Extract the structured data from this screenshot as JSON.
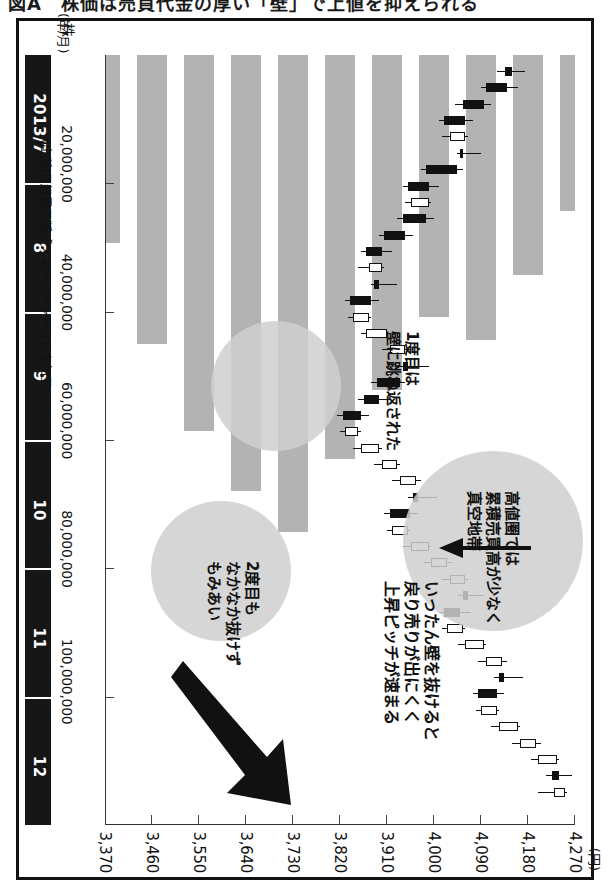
{
  "caption": {
    "text": "図A　株価は売買代金の厚い「壁」で上値を抑えられる"
  },
  "chart_data": {
    "type": "candlestick",
    "title": "",
    "xlabel": "(年/月)",
    "ylabel": "(円)",
    "price_axis": {
      "unit": "(円)",
      "ticks": [
        "3,370",
        "3,460",
        "3,550",
        "3,640",
        "3,730",
        "3,820",
        "3,910",
        "4,000",
        "4,090",
        "4,180",
        "4,270"
      ],
      "min": 3370,
      "max": 4270,
      "step": 90
    },
    "volume_axis": {
      "unit": "株",
      "ticks": [
        "20,000,000",
        "40,000,000",
        "60,000,000",
        "80,000,000",
        "100,000,000"
      ],
      "min": 0,
      "max": 110000000,
      "step": 20000000
    },
    "time_axis": {
      "unit": "(年/月)",
      "labels": [
        "2013/7",
        "8",
        "9",
        "10",
        "11",
        "12"
      ]
    },
    "series": [
      {
        "name": "株価（日足・ローソク足）",
        "type": "candlestick",
        "ohlc": [
          [
            4150,
            4175,
            4120,
            4135
          ],
          [
            4140,
            4160,
            4090,
            4100
          ],
          [
            4095,
            4110,
            4040,
            4055
          ],
          [
            4060,
            4075,
            4010,
            4020
          ],
          [
            4030,
            4065,
            4015,
            4060
          ],
          [
            4055,
            4090,
            4045,
            4050
          ],
          [
            4045,
            4055,
            3975,
            3985
          ],
          [
            3990,
            4010,
            3940,
            3950
          ],
          [
            3955,
            3995,
            3945,
            3990
          ],
          [
            3985,
            4000,
            3930,
            3940
          ],
          [
            3945,
            3960,
            3895,
            3905
          ],
          [
            3900,
            3920,
            3860,
            3870
          ],
          [
            3875,
            3905,
            3855,
            3900
          ],
          [
            3895,
            3930,
            3880,
            3885
          ],
          [
            3880,
            3895,
            3830,
            3840
          ],
          [
            3845,
            3880,
            3835,
            3875
          ],
          [
            3870,
            3915,
            3860,
            3910
          ],
          [
            3915,
            3955,
            3900,
            3945
          ],
          [
            3950,
            3990,
            3930,
            3940
          ],
          [
            3935,
            3945,
            3880,
            3890
          ],
          [
            3895,
            3915,
            3855,
            3865
          ],
          [
            3860,
            3875,
            3815,
            3825
          ],
          [
            3830,
            3860,
            3820,
            3855
          ],
          [
            3860,
            3900,
            3845,
            3895
          ],
          [
            3900,
            3935,
            3885,
            3930
          ],
          [
            3935,
            3975,
            3920,
            3965
          ],
          [
            3970,
            4005,
            3950,
            3960
          ],
          [
            3955,
            3970,
            3905,
            3915
          ],
          [
            3920,
            3955,
            3910,
            3950
          ],
          [
            3955,
            3995,
            3940,
            3990
          ],
          [
            3995,
            4035,
            3980,
            4025
          ],
          [
            4030,
            4065,
            4015,
            4060
          ],
          [
            4065,
            4095,
            4045,
            4055
          ],
          [
            4050,
            4070,
            4010,
            4020
          ],
          [
            4025,
            4060,
            4015,
            4055
          ],
          [
            4060,
            4100,
            4045,
            4095
          ],
          [
            4100,
            4140,
            4085,
            4130
          ],
          [
            4135,
            4170,
            4115,
            4125
          ],
          [
            4120,
            4135,
            4075,
            4085
          ],
          [
            4090,
            4125,
            4080,
            4120
          ],
          [
            4125,
            4165,
            4110,
            4160
          ],
          [
            4165,
            4205,
            4150,
            4195
          ],
          [
            4200,
            4240,
            4185,
            4235
          ],
          [
            4240,
            4265,
            4215,
            4225
          ],
          [
            4230,
            4255,
            4200,
            4250
          ]
        ]
      },
      {
        "name": "累積売買高（価格帯別出来高）",
        "type": "volume-by-price",
        "bars": [
          {
            "price": "4,270",
            "volume": 34000000
          },
          {
            "price": "4,180",
            "volume": 48000000
          },
          {
            "price": "4,090",
            "volume": 62000000
          },
          {
            "price": "4,000",
            "volume": 57000000
          },
          {
            "price": "3,910",
            "volume": 73000000
          },
          {
            "price": "3,820",
            "volume": 88000000
          },
          {
            "price": "3,730",
            "volume": 104000000
          },
          {
            "price": "3,640",
            "volume": 95000000
          },
          {
            "price": "3,550",
            "volume": 82000000
          },
          {
            "price": "3,460",
            "volume": 63000000
          },
          {
            "price": "3,370",
            "volume": 41000000
          }
        ]
      }
    ],
    "annotations": [
      {
        "id": "a1",
        "text": "高値圏では\n累積売買高が少なく\n真空地帯"
      },
      {
        "id": "a2",
        "text": "1度目は\n壁に跳ね返された"
      },
      {
        "id": "a3",
        "text": "いったん壁を抜けると\n戻り売りが出にくく\n上昇ピッチが速まる"
      },
      {
        "id": "a4",
        "text": "2度目も\nなかなか抜けず\nもみあい"
      }
    ],
    "grid": false,
    "legend": "none"
  },
  "source": {
    "text": "(出所)日経電子版「スマートチャート」を加工"
  }
}
